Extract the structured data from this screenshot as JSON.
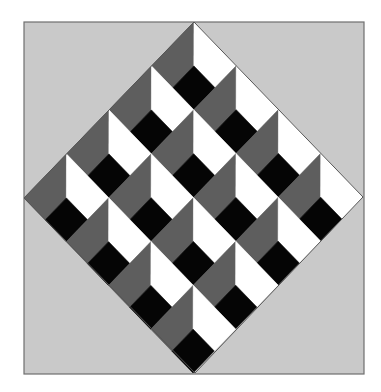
{
  "figure": {
    "canvas": {
      "width": 381,
      "height": 392,
      "page_color": "#ffffff"
    },
    "frame": {
      "x": 24,
      "y": 22,
      "width": 340,
      "height": 352,
      "fill": "#c9c9c9",
      "stroke": "#6f6f6f",
      "stroke_width": 1.2
    },
    "diamond": {
      "top": [
        194,
        22
      ],
      "right": [
        363,
        197
      ],
      "bottom": [
        195,
        373
      ],
      "left": [
        24,
        198
      ],
      "rows": 4,
      "cols": 4,
      "outline": "#555555"
    },
    "cell_colors": {
      "gray": "#5e5e5e",
      "white": "#ffffff",
      "black": "#050505"
    },
    "cell_split": {
      "black_start": 0.5
    }
  }
}
